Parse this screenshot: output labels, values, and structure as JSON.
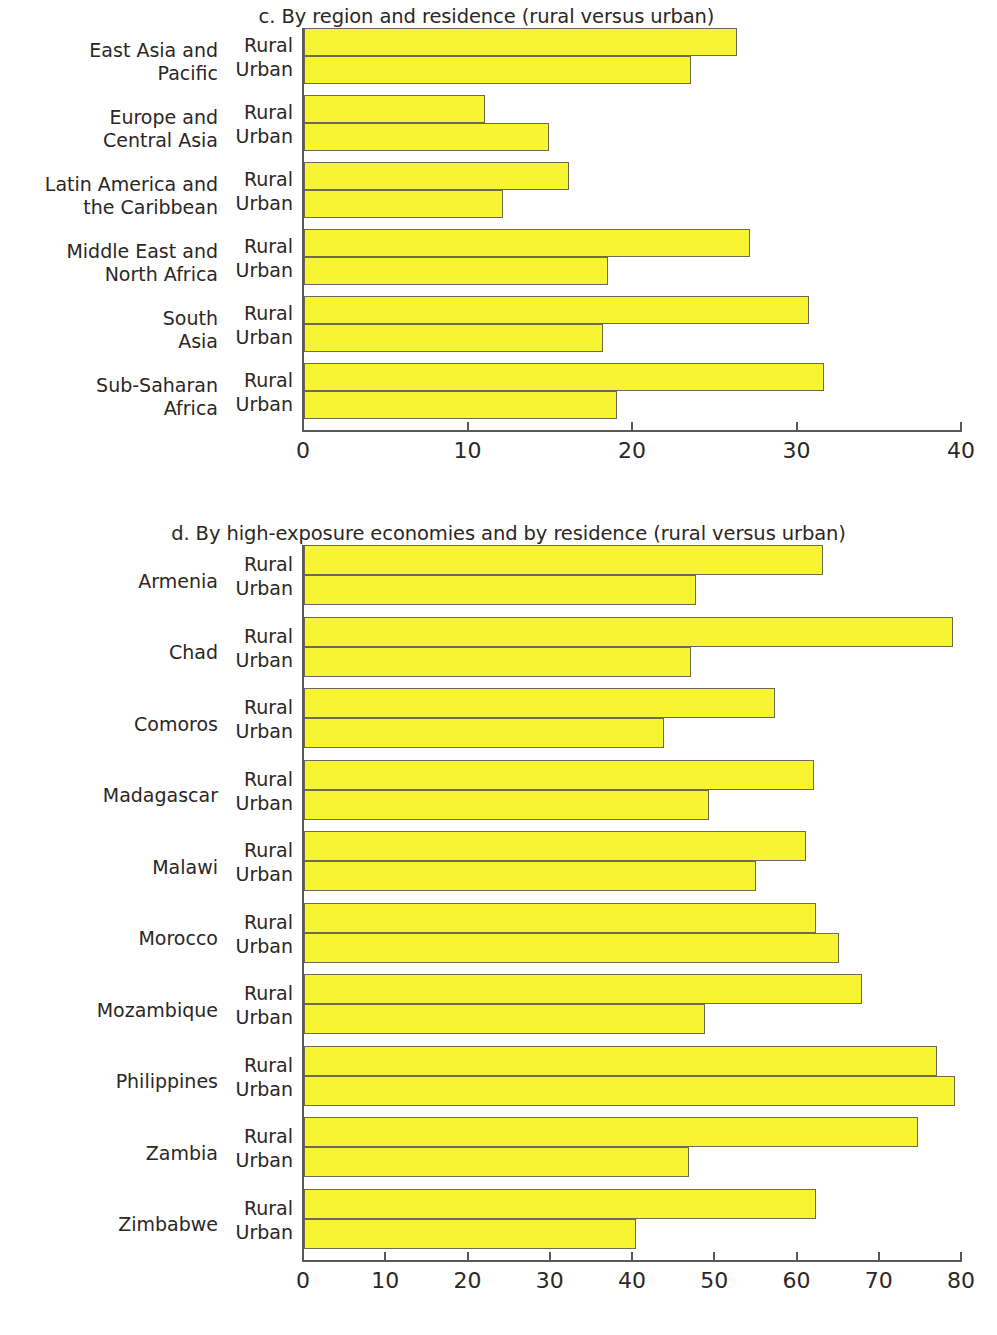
{
  "colors": {
    "bar_fill": "#f7f433",
    "bar_stroke": "#6d6a52",
    "axis": "#58595b",
    "text": "#2b2725",
    "background": "#ffffff"
  },
  "panel_c": {
    "title": "c. By region and residence (rural versus urban)",
    "series_labels": {
      "rural": "Rural",
      "urban": "Urban"
    },
    "axis_ticks": [
      "0",
      "10",
      "20",
      "30",
      "40"
    ]
  },
  "panel_d": {
    "title": "d. By high-exposure economies and by residence (rural versus urban)",
    "series_labels": {
      "rural": "Rural",
      "urban": "Urban"
    },
    "axis_ticks": [
      "0",
      "10",
      "20",
      "30",
      "40",
      "50",
      "60",
      "70",
      "80"
    ]
  },
  "chart_data": [
    {
      "type": "bar",
      "orientation": "horizontal",
      "title": "c. By region and residence (rural versus urban)",
      "xlabel": "",
      "ylabel": "",
      "xlim": [
        0,
        40
      ],
      "xticks": [
        0,
        10,
        20,
        30,
        40
      ],
      "grid": false,
      "legend": "none",
      "categories": [
        "East Asia and Pacific",
        "Europe and Central Asia",
        "Latin America and the Caribbean",
        "Middle East and North Africa",
        "South Asia",
        "Sub-Saharan Africa"
      ],
      "category_lines": [
        [
          "East Asia and",
          "Pacific"
        ],
        [
          "Europe and",
          "Central Asia"
        ],
        [
          "Latin America and",
          "the Caribbean"
        ],
        [
          "Middle East and",
          "North Africa"
        ],
        [
          "South",
          "Asia"
        ],
        [
          "Sub-Saharan",
          "Africa"
        ]
      ],
      "series": [
        {
          "name": "Rural",
          "values": [
            26.3,
            11.0,
            16.1,
            27.1,
            30.7,
            31.6
          ]
        },
        {
          "name": "Urban",
          "values": [
            23.5,
            14.9,
            12.1,
            18.5,
            18.2,
            19.0
          ]
        }
      ]
    },
    {
      "type": "bar",
      "orientation": "horizontal",
      "title": "d. By high-exposure economies and by residence (rural versus urban)",
      "xlabel": "",
      "ylabel": "",
      "xlim": [
        0,
        80
      ],
      "xticks": [
        0,
        10,
        20,
        30,
        40,
        50,
        60,
        70,
        80
      ],
      "grid": false,
      "legend": "none",
      "categories": [
        "Armenia",
        "Chad",
        "Comoros",
        "Madagascar",
        "Malawi",
        "Morocco",
        "Mozambique",
        "Philippines",
        "Zambia",
        "Zimbabwe"
      ],
      "category_lines": [
        [
          "Armenia"
        ],
        [
          "Chad"
        ],
        [
          "Comoros"
        ],
        [
          "Madagascar"
        ],
        [
          "Malawi"
        ],
        [
          "Morocco"
        ],
        [
          "Mozambique"
        ],
        [
          "Philippines"
        ],
        [
          "Zambia"
        ],
        [
          "Zimbabwe"
        ]
      ],
      "series": [
        {
          "name": "Rural",
          "values": [
            63.1,
            78.9,
            57.3,
            62.0,
            61.0,
            62.3,
            67.8,
            76.9,
            74.6,
            62.3
          ]
        },
        {
          "name": "Urban",
          "values": [
            47.6,
            47.0,
            43.8,
            49.2,
            54.9,
            65.0,
            48.7,
            79.1,
            46.8,
            40.4
          ]
        }
      ]
    }
  ]
}
